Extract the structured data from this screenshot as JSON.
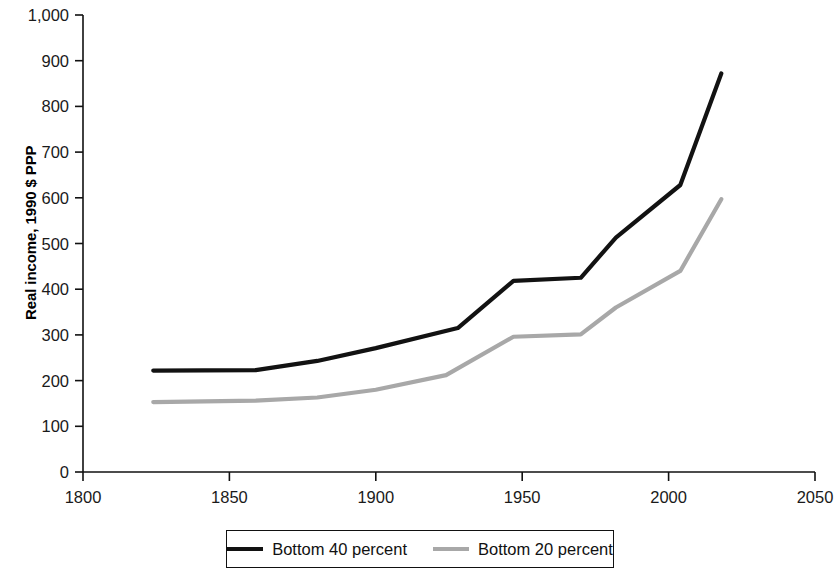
{
  "chart_data": {
    "type": "line",
    "title": "",
    "xlabel": "",
    "ylabel": "Real income, 1990 $ PPP",
    "xlim": [
      1800,
      2050
    ],
    "ylim": [
      0,
      1000
    ],
    "xticks": [
      1800,
      1850,
      1900,
      1950,
      2000,
      2050
    ],
    "xtick_labels": [
      "1800",
      "1850",
      "1900",
      "1950",
      "2000",
      "2050"
    ],
    "yticks": [
      0,
      100,
      200,
      300,
      400,
      500,
      600,
      700,
      800,
      900,
      1000
    ],
    "ytick_labels": [
      "0",
      "100",
      "200",
      "300",
      "400",
      "500",
      "600",
      "700",
      "800",
      "900",
      "1,000"
    ],
    "grid": false,
    "legend_position": "below-axes",
    "series": [
      {
        "name": "Bottom 40 percent",
        "color": "#121212",
        "line_width": 4.2,
        "x": [
          1824,
          1859,
          1880,
          1900,
          1928,
          1947,
          1970,
          1982,
          2004,
          2018
        ],
        "values": [
          222,
          223,
          243,
          271,
          315,
          418,
          425,
          513,
          628,
          872
        ]
      },
      {
        "name": "Bottom 20 percent",
        "color": "#a8a8a8",
        "line_width": 4.2,
        "x": [
          1824,
          1859,
          1880,
          1900,
          1924,
          1947,
          1970,
          1982,
          2004,
          2018
        ],
        "values": [
          153,
          156,
          163,
          180,
          212,
          296,
          301,
          360,
          440,
          597
        ]
      }
    ]
  },
  "legend": {
    "entries": [
      {
        "label": "Bottom 40 percent",
        "color": "#121212"
      },
      {
        "label": "Bottom 20 percent",
        "color": "#a8a8a8"
      }
    ]
  }
}
